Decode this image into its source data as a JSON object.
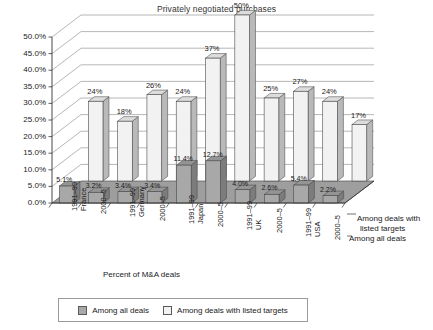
{
  "chart_data": {
    "type": "bar",
    "title": "Privately negotiated purchases",
    "xlabel": "Percent of M&A deals",
    "ylabel": "",
    "ylim": [
      0,
      50
    ],
    "ytick_labels": [
      "0.0%",
      "5.0%",
      "10.0%",
      "15.0%",
      "20.0%",
      "25.0%",
      "30.0%",
      "35.0%",
      "40.0%",
      "45.0%",
      "50.0%"
    ],
    "ytick_values": [
      0,
      5,
      10,
      15,
      20,
      25,
      30,
      35,
      40,
      45,
      50
    ],
    "grid": true,
    "legend_position": "bottom",
    "projection": "3d",
    "categories": [
      {
        "period": "1991–99",
        "country": "France"
      },
      {
        "period": "2000–5",
        "country": ""
      },
      {
        "period": "1991–99",
        "country": "Germany"
      },
      {
        "period": "2000–5",
        "country": ""
      },
      {
        "period": "1991–99",
        "country": "Japan"
      },
      {
        "period": "2000–5",
        "country": ""
      },
      {
        "period": "1991–99",
        "country": "UK"
      },
      {
        "period": "2000–5",
        "country": ""
      },
      {
        "period": "1991–99",
        "country": "USA"
      },
      {
        "period": "2000–5",
        "country": ""
      }
    ],
    "series": [
      {
        "name": "Among all deals",
        "values": [
          5.1,
          3.2,
          3.4,
          3.4,
          11.4,
          12.7,
          4.0,
          2.6,
          5.4,
          2.2
        ],
        "labels": [
          "5.1%",
          "3.2%",
          "3.4%",
          "3.4%",
          "11.4%",
          "12.7%",
          "4.0%",
          "2.6%",
          "5.4%",
          "2.2%"
        ],
        "color": "#a8a8a8"
      },
      {
        "name": "Among deals with listed targets",
        "values": [
          24,
          18,
          26,
          24,
          37,
          50,
          25,
          27,
          24,
          17
        ],
        "labels": [
          "24%",
          "18%",
          "26%",
          "24%",
          "37%",
          "50%",
          "25%",
          "27%",
          "24%",
          "17%"
        ],
        "color": "#f2f2f2"
      }
    ]
  },
  "legend": {
    "items": [
      {
        "label": "Among all deals"
      },
      {
        "label": "Among deals with listed targets"
      }
    ]
  },
  "depth_axis": {
    "back_line1": "Among deals with",
    "back_line2": "listed targets",
    "front": "Among all deals"
  }
}
